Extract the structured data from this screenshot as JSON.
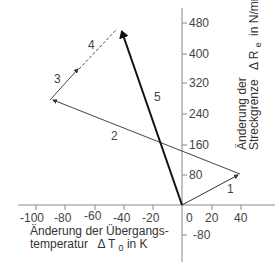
{
  "diagram": {
    "x_axis": {
      "title_line1": "Änderung der Übergangs-",
      "title_line2_prefix": "temperatur",
      "title_line2_symbol": "Δ T",
      "title_line2_sub": "0",
      "title_line2_suffix": "in K",
      "ticks": [
        "-100",
        "-80",
        "-60",
        "-40",
        "-20",
        "0",
        "20",
        "40"
      ]
    },
    "y_axis": {
      "title_line1": "Änderung der",
      "title_line2": "Streckgrenze",
      "title_symbol": "Δ R",
      "title_sub": "e",
      "title_unit": "in N/mm²",
      "ticks": [
        "480",
        "400",
        "320",
        "240",
        "160",
        "80",
        "-80"
      ]
    },
    "segments": [
      {
        "label": "1",
        "from": [
          0,
          0
        ],
        "to": [
          40,
          80
        ],
        "style": "thin"
      },
      {
        "label": "2",
        "from": [
          40,
          80
        ],
        "to": [
          -92,
          275
        ],
        "style": "thin"
      },
      {
        "label": "3",
        "from": [
          -92,
          275
        ],
        "to": [
          -67,
          360
        ],
        "style": "thin"
      },
      {
        "label": "4",
        "from": [
          -67,
          360
        ],
        "to": [
          -42,
          470
        ],
        "style": "dashed"
      },
      {
        "label": "5",
        "from": [
          0,
          0
        ],
        "to": [
          -42,
          470
        ],
        "style": "bold-arrow"
      }
    ]
  }
}
